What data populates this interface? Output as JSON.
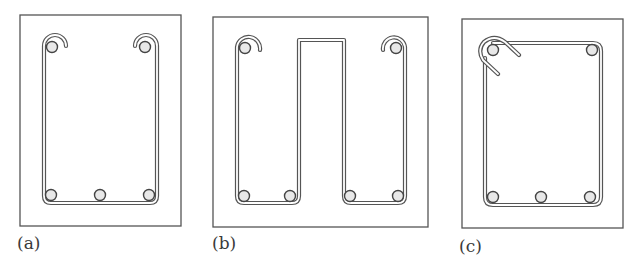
{
  "figure": {
    "panels": [
      {
        "id": "a",
        "label": "(a)",
        "type": "open U-stirrup with semicircular hooks at top",
        "top_bars": 2,
        "bottom_bars": 3
      },
      {
        "id": "b",
        "label": "(b)",
        "type": "double U-stirrup (W-shaped) with semicircular hooks at top corners",
        "top_bars": 2,
        "bottom_bars": 4
      },
      {
        "id": "c",
        "label": "(c)",
        "type": "closed rectangular tie with 135-degree seismic hooks at top-left corner",
        "top_bars": 2,
        "bottom_bars": 3
      }
    ]
  },
  "colors": {
    "line": "#555555",
    "background": "#ffffff",
    "label": "#3a3a3a"
  }
}
